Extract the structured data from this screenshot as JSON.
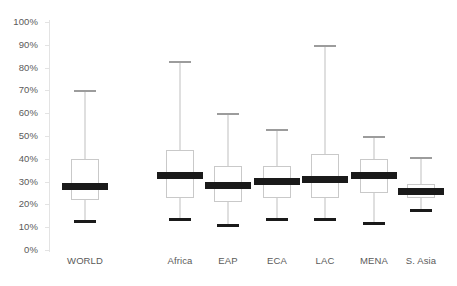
{
  "chart_data": {
    "type": "box",
    "title": "",
    "xlabel": "",
    "ylabel": "",
    "ylim": [
      0,
      100
    ],
    "ytick_labels": [
      "0%",
      "10%",
      "20%",
      "30%",
      "40%",
      "50%",
      "60%",
      "70%",
      "80%",
      "90%",
      "100%"
    ],
    "ytick_values": [
      0,
      10,
      20,
      30,
      40,
      50,
      60,
      70,
      80,
      90,
      100
    ],
    "grid": false,
    "legend": "none",
    "categories": [
      "WORLD",
      "Africa",
      "EAP",
      "ECA",
      "LAC",
      "MENA",
      "S. Asia"
    ],
    "boxes": [
      {
        "category": "WORLD",
        "whisker_high": 70,
        "q3": 40,
        "median": 28,
        "q1": 22,
        "whisker_low": 13
      },
      {
        "category": "Africa",
        "whisker_high": 83,
        "q3": 44,
        "median": 32.5,
        "q1": 23,
        "whisker_low": 14
      },
      {
        "category": "EAP",
        "whisker_high": 60,
        "q3": 37,
        "median": 28.5,
        "q1": 21,
        "whisker_low": 11.5
      },
      {
        "category": "ECA",
        "whisker_high": 53,
        "q3": 37,
        "median": 30,
        "q1": 23,
        "whisker_low": 14
      },
      {
        "category": "LAC",
        "whisker_high": 90,
        "q3": 42,
        "median": 31,
        "q1": 23,
        "whisker_low": 14
      },
      {
        "category": "MENA",
        "whisker_high": 50,
        "q3": 40,
        "median": 32.5,
        "q1": 25,
        "whisker_low": 12.5
      },
      {
        "category": "S. Asia",
        "whisker_high": 41,
        "q3": 29,
        "median": 25.5,
        "q1": 23,
        "whisker_low": 18
      }
    ],
    "colors": {
      "median": "#1a1a1a",
      "box_border": "#c9c9c9",
      "box_fill": "#ffffff",
      "whisker": "#bfbfbf",
      "axis": "#e3e3e3",
      "text": "#5a5a5a",
      "background": "#ffffff"
    }
  },
  "layout": {
    "category_centers_px": [
      85,
      180,
      228,
      277,
      325,
      374,
      421
    ],
    "box_width_px": 28,
    "median_width_px": 46,
    "cap_width_px": 22,
    "plot_left_px": 50,
    "plot_top_px": 18,
    "y_zero_px": 232,
    "y_hundred_px": 4
  }
}
